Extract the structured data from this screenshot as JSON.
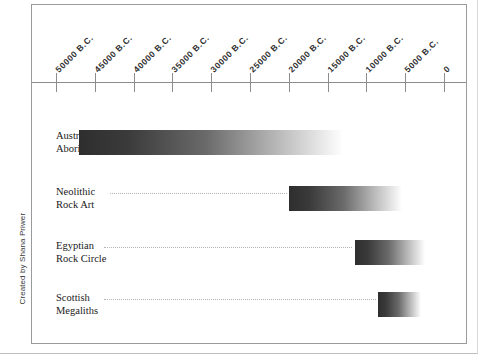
{
  "credit": "Created by Shana Priwer",
  "chart_data": {
    "type": "bar",
    "orientation": "horizontal",
    "title": "",
    "xlabel": "",
    "ylabel": "",
    "grid": false,
    "legend": false,
    "axis": {
      "position": "top",
      "direction": "reversed",
      "xlim": [
        50000,
        0
      ],
      "tick_values": [
        50000,
        45000,
        40000,
        35000,
        30000,
        25000,
        20000,
        15000,
        10000,
        5000,
        0
      ],
      "tick_labels": [
        "50000 B.C.",
        "45000 B.C.",
        "40000 B.C.",
        "35000 B.C.",
        "30000 B.C.",
        "25000 B.C.",
        "20000 B.C.",
        "15000 B.C.",
        "10000 B.C.",
        "5000 B.C.",
        "0"
      ]
    },
    "categories": [
      "Australian Aborigines",
      "Neolithic Rock Art",
      "Egyptian Rock Circle",
      "Scottish Megaliths"
    ],
    "bars": [
      {
        "label_line1": "Australian",
        "label_line2": "Aborigines",
        "start_bc": 47000,
        "end_bc": 13000,
        "fill": "gradient-dark-to-white"
      },
      {
        "label_line1": "Neolithic",
        "label_line2": "Rock Art",
        "start_bc": 20000,
        "end_bc": 5500,
        "fill": "gradient-dark-to-white"
      },
      {
        "label_line1": "Egyptian",
        "label_line2": "Rock Circle",
        "start_bc": 11500,
        "end_bc": 2500,
        "fill": "gradient-dark-to-white"
      },
      {
        "label_line1": "Scottish",
        "label_line2": "Megaliths",
        "start_bc": 8500,
        "end_bc": 3000,
        "fill": "gradient-dark-to-white"
      }
    ],
    "colors": {
      "bar_dark": "#2e2e2e",
      "bar_light": "#ffffff",
      "axis": "#8d8d8d",
      "frame": "#9a9a9a",
      "text": "#1a1a1a",
      "leader_dots": "#b4b4b4"
    }
  }
}
